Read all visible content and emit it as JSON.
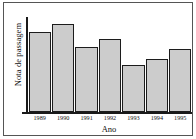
{
  "chart_data": {
    "type": "bar",
    "title": "",
    "xlabel": "Ano",
    "ylabel": "Nota de passagem",
    "categories": [
      "1989",
      "1990",
      "1991",
      "1992",
      "1993",
      "1994",
      "1995"
    ],
    "values": [
      83,
      92,
      68,
      76,
      49,
      55,
      66
    ],
    "ylim": [
      0,
      100
    ],
    "xlim": [
      0,
      7
    ],
    "grid": false,
    "legend": null,
    "bar_fill_color": "#cccccc",
    "bar_edge_color": "#1c1c1c",
    "axis_color": "#1a1a1a",
    "frame_color": "#555555",
    "background_color": "#ffffff",
    "y_tick_labels": [],
    "annotations": []
  }
}
